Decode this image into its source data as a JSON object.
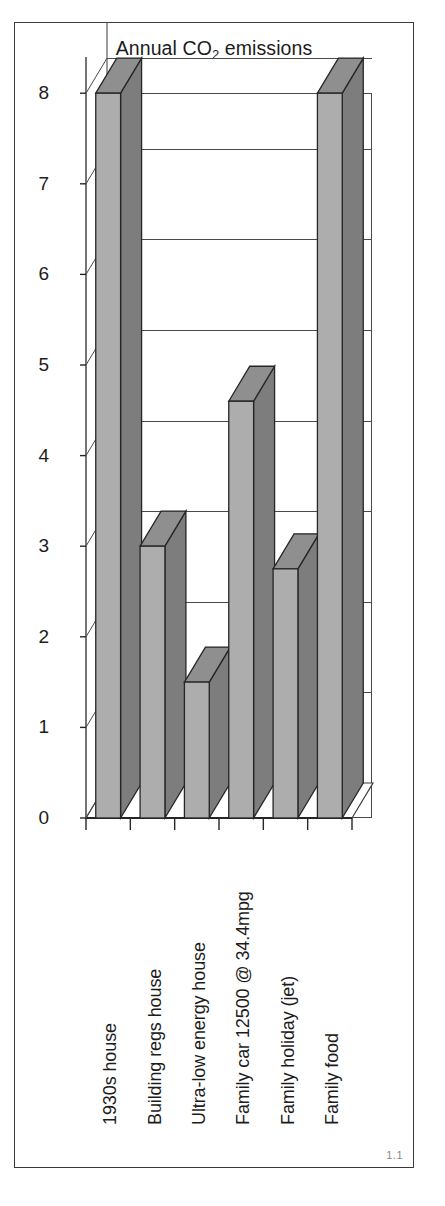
{
  "figure": {
    "number_label": "1.1",
    "title_main": "Annual CO",
    "title_sub": "2",
    "title_tail": " emissions"
  },
  "chart_data": {
    "type": "bar",
    "title": "Annual CO2 emissions",
    "xlabel": "",
    "ylabel": "",
    "ylim": [
      0,
      8.4
    ],
    "yticks": [
      0,
      1,
      2,
      3,
      4,
      5,
      6,
      7,
      8
    ],
    "ytick_labels": [
      "0",
      "1",
      "2",
      "3",
      "4",
      "5",
      "6",
      "7",
      "8"
    ],
    "grid": true,
    "legend": "none",
    "style": "3d-column",
    "categories": [
      "1930s house",
      "Building regs house",
      "Ultra-low energy house",
      "Family car 12500 @ 34.4mpg",
      "Family holiday (jet)",
      "Family food"
    ],
    "values": [
      8.0,
      3.0,
      1.5,
      4.6,
      2.75,
      8.0
    ],
    "bar_face_color": "#adadad",
    "bar_side_color": "#7d7d7d",
    "bar_top_color": "#8f8f8f",
    "outline_color": "#262626"
  }
}
